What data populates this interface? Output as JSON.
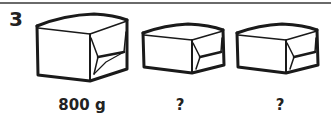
{
  "exercise": {
    "number": "3"
  },
  "items": [
    {
      "label": "800 g",
      "icon": "package-box-icon"
    },
    {
      "label": "?",
      "icon": "package-box-icon"
    },
    {
      "label": "?",
      "icon": "package-box-icon"
    }
  ]
}
